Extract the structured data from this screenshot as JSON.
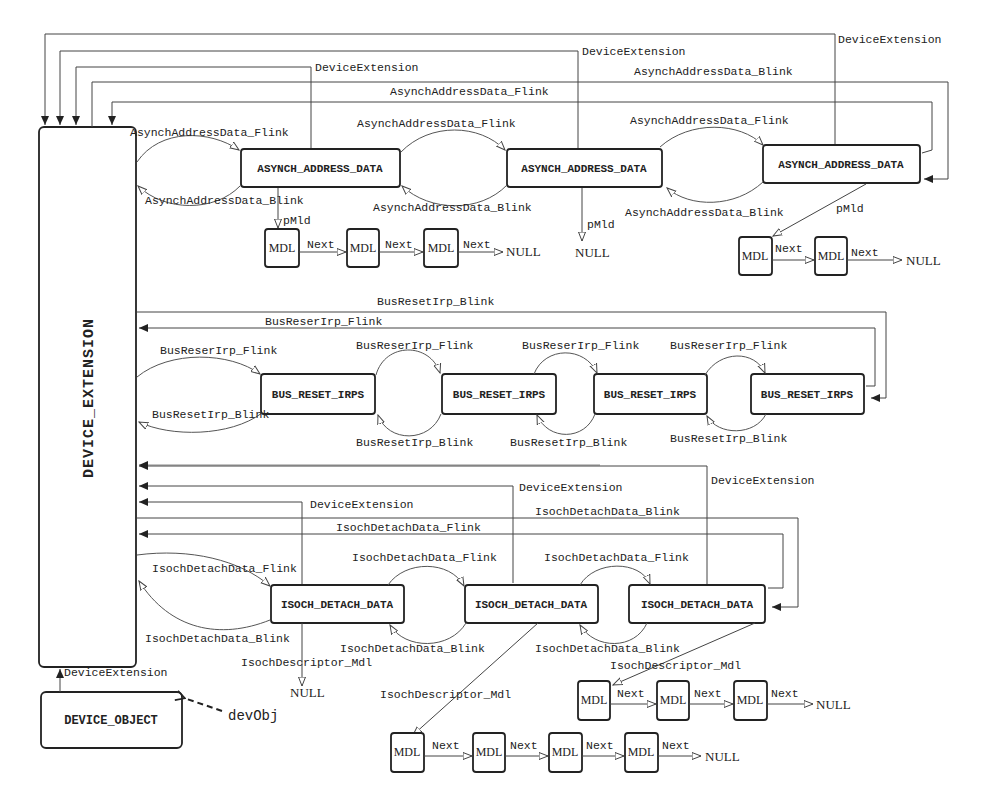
{
  "device_extension": {
    "label": "DEVICE_EXTENSION"
  },
  "device_object": {
    "label": "DEVICE_OBJECT",
    "link_label": "DeviceExtension",
    "ref_label": "devObj"
  },
  "top_links": {
    "dev_ext_1": "DeviceExtension",
    "dev_ext_2": "DeviceExtension",
    "dev_ext_3": "DeviceExtension",
    "blink_long": "AsynchAddressData_Blink",
    "flink_long": "AsynchAddressData_Flink"
  },
  "asynch": {
    "nodes": [
      "ASYNCH_ADDRESS_DATA",
      "ASYNCH_ADDRESS_DATA",
      "ASYNCH_ADDRESS_DATA"
    ],
    "flink": "AsynchAddressData_Flink",
    "blink": "AsynchAddressData_Blink",
    "pmdl": "pMld",
    "mdl_chain_1": [
      "MDL",
      "MDL",
      "MDL"
    ],
    "mdl_chain_3": [
      "MDL",
      "MDL"
    ],
    "next": "Next",
    "null": "NULL"
  },
  "bus_reset": {
    "nodes": [
      "BUS_RESET_IRPS",
      "BUS_RESET_IRPS",
      "BUS_RESET_IRPS",
      "BUS_RESET_IRPS"
    ],
    "flink": "BusReserIrp_Flink",
    "blink": "BusResetIrp_Blink",
    "long_blink": "BusResetIrp_Blink",
    "long_flink": "BusReserIrp_Flink"
  },
  "isoch": {
    "nodes": [
      "ISOCH_DETACH_DATA",
      "ISOCH_DETACH_DATA",
      "ISOCH_DETACH_DATA"
    ],
    "flink": "IsochDetachData_Flink",
    "blink": "IsochDetachData_Blink",
    "dev_ext_a": "DeviceExtension",
    "dev_ext_b": "DeviceExtension",
    "dev_ext_c": "DeviceExtension",
    "long_blink": "IsochDetachData_Blink",
    "long_flink": "IsochDetachData_Flink",
    "descriptor": "IsochDescriptor_Mdl",
    "mdl_chain_2": [
      "MDL",
      "MDL",
      "MDL",
      "MDL"
    ],
    "mdl_chain_3": [
      "MDL",
      "MDL",
      "MDL"
    ],
    "next": "Next",
    "null": "NULL"
  }
}
